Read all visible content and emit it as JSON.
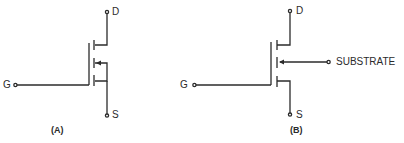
{
  "diagram": {
    "type": "mosfet-schematic-symbols",
    "stroke_color": "#2b2b2b",
    "background": "#ffffff",
    "figures": [
      {
        "id": "A",
        "caption": "(A)",
        "terminals": {
          "drain": "D",
          "gate": "G",
          "source": "S"
        },
        "description": "MOSFET symbol with substrate internally connected to source"
      },
      {
        "id": "B",
        "caption": "(B)",
        "terminals": {
          "drain": "D",
          "gate": "G",
          "source": "S",
          "substrate": "SUBSTRATE"
        },
        "description": "MOSFET symbol with separate substrate terminal"
      }
    ]
  }
}
